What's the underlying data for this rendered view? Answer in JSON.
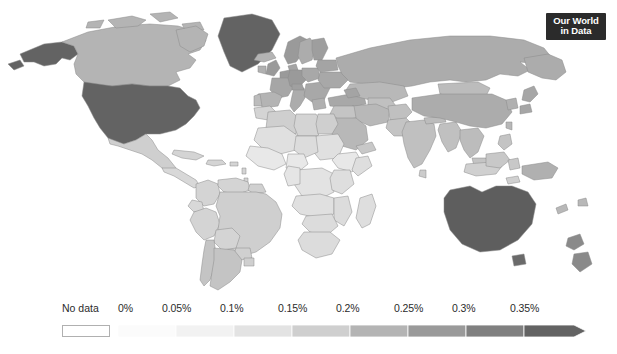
{
  "logo": {
    "line1": "Our World",
    "line2": "in Data"
  },
  "legend": {
    "no_data_label": "No data",
    "no_data_color": "#ffffff",
    "ticks": [
      "0%",
      "0.05%",
      "0.1%",
      "0.15%",
      "0.2%",
      "0.25%",
      "0.3%",
      "0.35%"
    ],
    "tick_values": [
      0,
      0.05,
      0.1,
      0.15,
      0.2,
      0.25,
      0.3,
      0.35
    ],
    "unit": "%",
    "open_ended_top": true
  },
  "chart_data": {
    "type": "heatmap",
    "title": "",
    "subtitle": "",
    "projection": "robinson",
    "color_scheme": "grayscale-sequential",
    "legend_position": "bottom",
    "xlabel": "",
    "ylabel": "",
    "bins": [
      {
        "from": 0,
        "to": 0.05,
        "label": "0% – 0.05%",
        "color": "#fbfbfb"
      },
      {
        "from": 0.05,
        "to": 0.1,
        "label": "0.05% – 0.1%",
        "color": "#f2f2f2"
      },
      {
        "from": 0.1,
        "to": 0.15,
        "label": "0.1% – 0.15%",
        "color": "#e3e3e3"
      },
      {
        "from": 0.15,
        "to": 0.2,
        "label": "0.15% – 0.2%",
        "color": "#cfcfcf"
      },
      {
        "from": 0.2,
        "to": 0.25,
        "label": "0.2% – 0.25%",
        "color": "#b4b4b4"
      },
      {
        "from": 0.25,
        "to": 0.3,
        "label": "0.25% – 0.3%",
        "color": "#9a9a9a"
      },
      {
        "from": 0.3,
        "to": 0.35,
        "label": "0.3% – 0.35%",
        "color": "#808080"
      },
      {
        "from": 0.35,
        "to": null,
        "label": "0.35% and more",
        "color": "#636363"
      }
    ],
    "no_data_color": "#ffffff",
    "countries": [
      {
        "name": "United States",
        "value": 0.36,
        "color": "#636363"
      },
      {
        "name": "Canada",
        "value": 0.2,
        "color": "#b4b4b4"
      },
      {
        "name": "Greenland",
        "value": 0.36,
        "color": "#636363"
      },
      {
        "name": "Alaska",
        "value": 0.36,
        "color": "#636363"
      },
      {
        "name": "Mexico",
        "value": 0.17,
        "color": "#cfcfcf"
      },
      {
        "name": "Brazil",
        "value": 0.17,
        "color": "#cfcfcf"
      },
      {
        "name": "Argentina",
        "value": 0.19,
        "color": "#c4c4c4"
      },
      {
        "name": "Chile",
        "value": 0.19,
        "color": "#c4c4c4"
      },
      {
        "name": "Colombia",
        "value": 0.16,
        "color": "#d4d4d4"
      },
      {
        "name": "Peru",
        "value": 0.16,
        "color": "#d4d4d4"
      },
      {
        "name": "Venezuela",
        "value": 0.16,
        "color": "#d4d4d4"
      },
      {
        "name": "Russia",
        "value": 0.22,
        "color": "#acacac"
      },
      {
        "name": "China",
        "value": 0.22,
        "color": "#acacac"
      },
      {
        "name": "India",
        "value": 0.19,
        "color": "#c0c0c0"
      },
      {
        "name": "Australia",
        "value": 0.36,
        "color": "#5e5e5e"
      },
      {
        "name": "New Zealand",
        "value": 0.3,
        "color": "#8a8a8a"
      },
      {
        "name": "Japan",
        "value": 0.24,
        "color": "#a6a6a6"
      },
      {
        "name": "Germany",
        "value": 0.26,
        "color": "#9a9a9a"
      },
      {
        "name": "France",
        "value": 0.24,
        "color": "#a6a6a6"
      },
      {
        "name": "United Kingdom",
        "value": 0.26,
        "color": "#9a9a9a"
      },
      {
        "name": "Spain",
        "value": 0.2,
        "color": "#b4b4b4"
      },
      {
        "name": "Italy",
        "value": 0.22,
        "color": "#acacac"
      },
      {
        "name": "Norway",
        "value": 0.26,
        "color": "#9a9a9a"
      },
      {
        "name": "Sweden",
        "value": 0.22,
        "color": "#acacac"
      },
      {
        "name": "Nigeria",
        "value": 0.1,
        "color": "#e8e8e8"
      },
      {
        "name": "Ethiopia",
        "value": 0.1,
        "color": "#e8e8e8"
      },
      {
        "name": "DR Congo",
        "value": 0.11,
        "color": "#e3e3e3"
      },
      {
        "name": "South Africa",
        "value": 0.14,
        "color": "#dcdcdc"
      },
      {
        "name": "Egypt",
        "value": 0.17,
        "color": "#cfcfcf"
      },
      {
        "name": "Algeria",
        "value": 0.17,
        "color": "#cfcfcf"
      },
      {
        "name": "Saudi Arabia",
        "value": 0.2,
        "color": "#b8b8b8"
      },
      {
        "name": "Kazakhstan",
        "value": 0.2,
        "color": "#b8b8b8"
      },
      {
        "name": "Indonesia",
        "value": 0.16,
        "color": "#d0d0d0"
      },
      {
        "name": "Madagascar",
        "value": 0.13,
        "color": "#dedede"
      }
    ]
  }
}
